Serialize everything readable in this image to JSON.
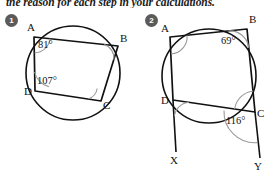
{
  "header": {
    "text": "the reason for each step in your calculations."
  },
  "problems": [
    {
      "badge": "1",
      "vertex_labels": {
        "A": "A",
        "B": "B",
        "C": "C",
        "D": "D"
      },
      "angles": [
        {
          "at": "A",
          "value": "81°"
        },
        {
          "at": "D",
          "value": "107°"
        }
      ],
      "unlabelled_angle_marks": [
        "B",
        "C"
      ],
      "shape": "cyclic quadrilateral ABCD inscribed in a circle"
    },
    {
      "badge": "2",
      "vertex_labels": {
        "A": "A",
        "B": "B",
        "C": "C",
        "D": "D"
      },
      "ray_labels": {
        "X": "X",
        "Y": "Y"
      },
      "angles": [
        {
          "at": "B",
          "value": "69°"
        },
        {
          "at": "C",
          "value": "116°"
        }
      ],
      "unlabelled_angle_marks": [
        "A",
        "D",
        "C"
      ],
      "shape": "cyclic quadrilateral ABCD inscribed in a circle with sides AD and BC extended beyond D and C to points X and Y"
    }
  ],
  "colors": {
    "stroke": "#111111",
    "arc": "#9a9a9a",
    "badge_bg": "#5b5b5b",
    "badge_fg": "#ffffff",
    "text": "#111111",
    "background": "#ffffff"
  }
}
